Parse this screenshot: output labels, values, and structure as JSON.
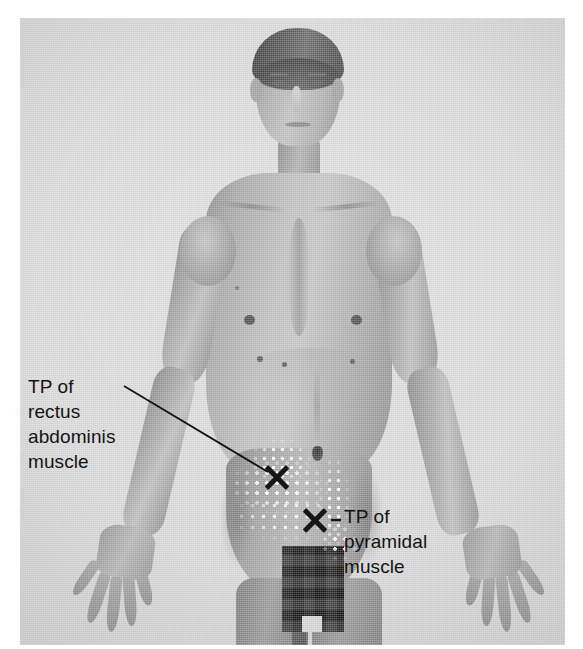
{
  "figure": {
    "type": "clinical-photograph",
    "modality": "grayscale-photo",
    "view": "anterior",
    "page_background": "#ffffff",
    "plate_background": "#d8d8d8",
    "annotation_color": "#141414"
  },
  "annotations": [
    {
      "id": "rectus-abdominis",
      "label_lines": [
        "TP of",
        "rectus",
        "abdominis",
        "muscle"
      ],
      "label_text": "TP of rectus abdominis muscle",
      "marker": "X",
      "marker_meaning": "trigger point",
      "label_x": 28,
      "label_y": 374,
      "marker_x": 277,
      "marker_y": 477,
      "leader": {
        "x1": 124,
        "y1": 386,
        "x2": 268,
        "y2": 472
      }
    },
    {
      "id": "pyramidal",
      "label_lines": [
        "TP of",
        "pyramidal",
        "muscle"
      ],
      "label_text": "TP of pyramidal muscle",
      "marker": "X",
      "marker_meaning": "trigger point",
      "label_x": 344,
      "label_y": 504,
      "marker_x": 315,
      "marker_y": 520,
      "leader": {
        "x1": 330,
        "y1": 520,
        "x2": 341,
        "y2": 520
      }
    }
  ],
  "legend": {
    "abbreviation": "TP",
    "abbreviation_meaning": "trigger point",
    "stipple_meaning": "referred pain pattern"
  },
  "body_marks": {
    "nipples": 2,
    "navel": 1,
    "censored_region": "pixelated genital area"
  }
}
